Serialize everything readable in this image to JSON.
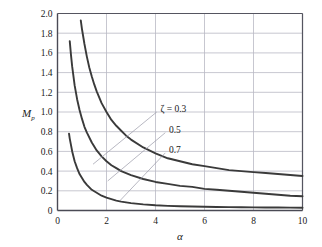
{
  "chart_data": {
    "type": "line",
    "title": "",
    "subtitle": "",
    "xlabel": "α",
    "ylabel": "M",
    "ylabel_sub": "p",
    "xlim": [
      0,
      10
    ],
    "ylim": [
      0,
      2.0
    ],
    "grid": true,
    "grid_x": [
      0,
      2,
      4,
      6,
      8,
      10
    ],
    "grid_y": [
      0,
      0.2,
      0.4,
      0.6,
      0.8,
      1.0,
      1.2,
      1.4,
      1.6,
      1.8,
      2.0
    ],
    "xticks": [
      0,
      2,
      4,
      6,
      8,
      10
    ],
    "xticklabels": [
      "0",
      "2",
      "4",
      "6",
      "8",
      "10"
    ],
    "yticks": [
      0,
      0.2,
      0.4,
      0.6,
      0.8,
      1.0,
      1.2,
      1.4,
      1.6,
      1.8,
      2.0
    ],
    "yticklabels": [
      "0",
      "0.2",
      "0.4",
      "0.6",
      "0.8",
      "1.0",
      "1.2",
      "1.4",
      "1.6",
      "1.8",
      "2.0"
    ],
    "legend_position": "inside-annotations",
    "line_color": "#3a3a3a",
    "grid_color": "#b9b9c4",
    "axis_color": "#555560",
    "leader_color": "#9a9aa8",
    "series": [
      {
        "name": "ζ = 0.3",
        "zeta": 0.3,
        "label": "ζ = 0.3",
        "label_symbol": "ζ",
        "label_value": "0.3",
        "points": [
          [
            0.95,
            1.93
          ],
          [
            1.0,
            1.84
          ],
          [
            1.1,
            1.69
          ],
          [
            1.2,
            1.56
          ],
          [
            1.3,
            1.45
          ],
          [
            1.4,
            1.36
          ],
          [
            1.5,
            1.28
          ],
          [
            1.6,
            1.21
          ],
          [
            1.8,
            1.09
          ],
          [
            2.0,
            1.0
          ],
          [
            2.2,
            0.92
          ],
          [
            2.4,
            0.86
          ],
          [
            2.6,
            0.81
          ],
          [
            2.8,
            0.76
          ],
          [
            3.0,
            0.72
          ],
          [
            3.5,
            0.64
          ],
          [
            4.0,
            0.58
          ],
          [
            4.5,
            0.53
          ],
          [
            5.0,
            0.5
          ],
          [
            5.5,
            0.47
          ],
          [
            6.0,
            0.45
          ],
          [
            6.5,
            0.43
          ],
          [
            7.0,
            0.41
          ],
          [
            7.5,
            0.4
          ],
          [
            8.0,
            0.39
          ],
          [
            8.5,
            0.38
          ],
          [
            9.0,
            0.37
          ],
          [
            9.5,
            0.36
          ],
          [
            10.0,
            0.35
          ]
        ]
      },
      {
        "name": "0.5",
        "zeta": 0.5,
        "label": "0.5",
        "label_value": "0.5",
        "points": [
          [
            0.5,
            1.72
          ],
          [
            0.55,
            1.58
          ],
          [
            0.6,
            1.46
          ],
          [
            0.7,
            1.27
          ],
          [
            0.8,
            1.13
          ],
          [
            0.9,
            1.02
          ],
          [
            1.0,
            0.93
          ],
          [
            1.1,
            0.85
          ],
          [
            1.2,
            0.79
          ],
          [
            1.4,
            0.69
          ],
          [
            1.6,
            0.61
          ],
          [
            1.8,
            0.55
          ],
          [
            2.0,
            0.5
          ],
          [
            2.2,
            0.46
          ],
          [
            2.4,
            0.43
          ],
          [
            2.6,
            0.4
          ],
          [
            2.8,
            0.38
          ],
          [
            3.0,
            0.36
          ],
          [
            3.5,
            0.32
          ],
          [
            4.0,
            0.29
          ],
          [
            4.5,
            0.27
          ],
          [
            5.0,
            0.25
          ],
          [
            5.5,
            0.24
          ],
          [
            6.0,
            0.22
          ],
          [
            6.5,
            0.21
          ],
          [
            7.0,
            0.2
          ],
          [
            7.5,
            0.19
          ],
          [
            8.0,
            0.18
          ],
          [
            8.5,
            0.17
          ],
          [
            9.0,
            0.16
          ],
          [
            9.5,
            0.15
          ],
          [
            10.0,
            0.145
          ]
        ]
      },
      {
        "name": "0.7",
        "zeta": 0.7,
        "label": "0.7",
        "label_value": "0.7",
        "points": [
          [
            0.47,
            0.78
          ],
          [
            0.5,
            0.73
          ],
          [
            0.6,
            0.6
          ],
          [
            0.7,
            0.5
          ],
          [
            0.8,
            0.43
          ],
          [
            0.9,
            0.37
          ],
          [
            1.0,
            0.33
          ],
          [
            1.1,
            0.29
          ],
          [
            1.2,
            0.26
          ],
          [
            1.4,
            0.21
          ],
          [
            1.6,
            0.18
          ],
          [
            1.8,
            0.15
          ],
          [
            2.0,
            0.13
          ],
          [
            2.2,
            0.115
          ],
          [
            2.4,
            0.1
          ],
          [
            2.6,
            0.09
          ],
          [
            2.8,
            0.082
          ],
          [
            3.0,
            0.075
          ],
          [
            3.5,
            0.062
          ],
          [
            4.0,
            0.053
          ],
          [
            4.5,
            0.047
          ],
          [
            5.0,
            0.043
          ],
          [
            5.5,
            0.04
          ],
          [
            6.0,
            0.038
          ],
          [
            6.5,
            0.036
          ],
          [
            7.0,
            0.034
          ],
          [
            7.5,
            0.033
          ],
          [
            8.0,
            0.032
          ],
          [
            8.5,
            0.031
          ],
          [
            9.0,
            0.03
          ],
          [
            9.5,
            0.029
          ],
          [
            10.0,
            0.028
          ]
        ]
      }
    ],
    "annotations": [
      {
        "text": "ζ = 0.3",
        "text_x": 4.2,
        "text_y": 1.03,
        "leader_from": [
          4.05,
          1.0
        ],
        "leader_to": [
          1.45,
          0.47
        ]
      },
      {
        "text": "0.5",
        "text_x": 4.55,
        "text_y": 0.82,
        "leader_from": [
          4.4,
          0.79
        ],
        "leader_to": [
          2.05,
          0.3
        ]
      },
      {
        "text": "0.7",
        "text_x": 4.55,
        "text_y": 0.615,
        "leader_from": [
          4.4,
          0.585
        ],
        "leader_to": [
          2.55,
          0.1
        ]
      }
    ]
  }
}
